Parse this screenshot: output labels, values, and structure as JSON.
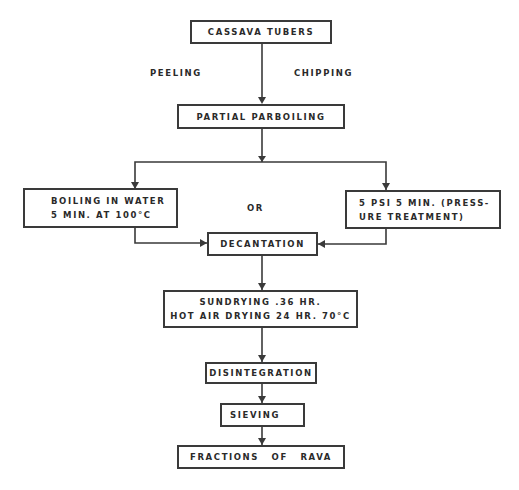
{
  "diagram": {
    "type": "process-flowchart",
    "nodes": {
      "cassava": {
        "lines": [
          "Cassava Tubers"
        ]
      },
      "parboil": {
        "lines": [
          "Partial Parboiling"
        ]
      },
      "boiling": {
        "lines": [
          "Boiling in Water",
          "5 Min. at 100°C"
        ]
      },
      "pressure": {
        "lines": [
          "5 Psi 5 Min. (Press-",
          "ure Treatment)"
        ]
      },
      "decant": {
        "lines": [
          "Decantation"
        ]
      },
      "drying": {
        "lines": [
          "Sundrying .36 Hr.",
          "Hot Air Drying 24 Hr. 70°C"
        ]
      },
      "disint": {
        "lines": [
          "Disintegration"
        ]
      },
      "sieving": {
        "lines": [
          "Sieving"
        ]
      },
      "fractions": {
        "lines": [
          "Fractions of Rava"
        ]
      }
    },
    "edge_labels": {
      "peeling": "Peeling",
      "chipping": "Chipping",
      "or": "OR"
    },
    "edges": [
      {
        "from": "cassava",
        "to": "parboil",
        "labels": [
          "Peeling",
          "Chipping"
        ]
      },
      {
        "from": "parboil",
        "to": "boiling"
      },
      {
        "from": "parboil",
        "to": "pressure"
      },
      {
        "from": "boiling",
        "to": "decant"
      },
      {
        "from": "pressure",
        "to": "decant"
      },
      {
        "from": "decant",
        "to": "drying"
      },
      {
        "from": "drying",
        "to": "disint"
      },
      {
        "from": "disint",
        "to": "sieving"
      },
      {
        "from": "sieving",
        "to": "fractions"
      }
    ]
  }
}
